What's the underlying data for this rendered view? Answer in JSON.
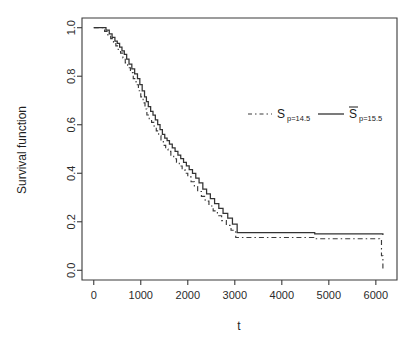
{
  "chart_data": {
    "type": "line",
    "title": "",
    "subtitle": "",
    "xlabel": "t",
    "ylabel": "Survival function",
    "xlim": [
      -250,
      6450
    ],
    "ylim": [
      -0.04,
      1.04
    ],
    "grid": false,
    "legend_position": "top-right-inside",
    "xticks": [
      0,
      1000,
      2000,
      3000,
      4000,
      5000,
      6000
    ],
    "xtick_labels": [
      "0",
      "1000",
      "2000",
      "3000",
      "4000",
      "5000",
      "6000"
    ],
    "yticks": [
      0.0,
      0.2,
      0.4,
      0.6,
      0.8,
      1.0
    ],
    "ytick_labels": [
      "0.0",
      "0.2",
      "0.4",
      "0.6",
      "0.8",
      "1.0"
    ],
    "series": [
      {
        "name": "S_p=14.5",
        "style": "dashed",
        "color": "#3b3b3b",
        "step": "post",
        "x": [
          0,
          170,
          230,
          300,
          360,
          420,
          470,
          520,
          570,
          620,
          670,
          720,
          780,
          840,
          900,
          950,
          1000,
          1050,
          1090,
          1130,
          1180,
          1230,
          1280,
          1330,
          1380,
          1430,
          1480,
          1530,
          1580,
          1640,
          1700,
          1760,
          1820,
          1880,
          1940,
          2000,
          2070,
          2140,
          2210,
          2290,
          2370,
          2450,
          2540,
          2630,
          2720,
          2820,
          2920,
          3020,
          4680,
          6080,
          6120,
          6150
        ],
        "y": [
          1.0,
          1.0,
          0.985,
          0.97,
          0.955,
          0.94,
          0.925,
          0.91,
          0.895,
          0.875,
          0.855,
          0.835,
          0.815,
          0.79,
          0.765,
          0.74,
          0.715,
          0.69,
          0.665,
          0.64,
          0.625,
          0.61,
          0.595,
          0.575,
          0.555,
          0.535,
          0.515,
          0.5,
          0.49,
          0.475,
          0.46,
          0.445,
          0.43,
          0.415,
          0.4,
          0.385,
          0.365,
          0.345,
          0.325,
          0.305,
          0.285,
          0.265,
          0.245,
          0.225,
          0.205,
          0.185,
          0.165,
          0.135,
          0.13,
          0.125,
          0.06,
          0.005
        ]
      },
      {
        "name": "S_p=15.5",
        "style": "solid",
        "color": "#333333",
        "step": "post",
        "x": [
          0,
          200,
          260,
          330,
          390,
          450,
          500,
          550,
          600,
          650,
          700,
          750,
          810,
          870,
          930,
          980,
          1030,
          1080,
          1120,
          1160,
          1210,
          1260,
          1310,
          1360,
          1410,
          1460,
          1510,
          1560,
          1610,
          1670,
          1730,
          1790,
          1850,
          1910,
          1970,
          2030,
          2100,
          2170,
          2240,
          2320,
          2400,
          2480,
          2570,
          2660,
          2750,
          2850,
          2950,
          3050,
          4700,
          6150
        ],
        "y": [
          1.0,
          1.0,
          0.99,
          0.975,
          0.96,
          0.945,
          0.935,
          0.92,
          0.905,
          0.89,
          0.87,
          0.85,
          0.83,
          0.81,
          0.79,
          0.765,
          0.74,
          0.715,
          0.695,
          0.675,
          0.655,
          0.64,
          0.62,
          0.6,
          0.58,
          0.56,
          0.545,
          0.535,
          0.52,
          0.505,
          0.49,
          0.475,
          0.46,
          0.445,
          0.43,
          0.415,
          0.4,
          0.38,
          0.36,
          0.335,
          0.315,
          0.295,
          0.275,
          0.255,
          0.235,
          0.215,
          0.19,
          0.155,
          0.15,
          0.145
        ]
      }
    ],
    "annotations": []
  },
  "legend": {
    "entries": [
      {
        "key": "dashed",
        "symbol": "S",
        "overbar": false,
        "subscript": "p=14.5"
      },
      {
        "key": "solid",
        "symbol": "S",
        "overbar": true,
        "subscript": "p=15.5"
      }
    ]
  },
  "axes": {
    "xlabel": "t",
    "ylabel": "Survival function"
  }
}
